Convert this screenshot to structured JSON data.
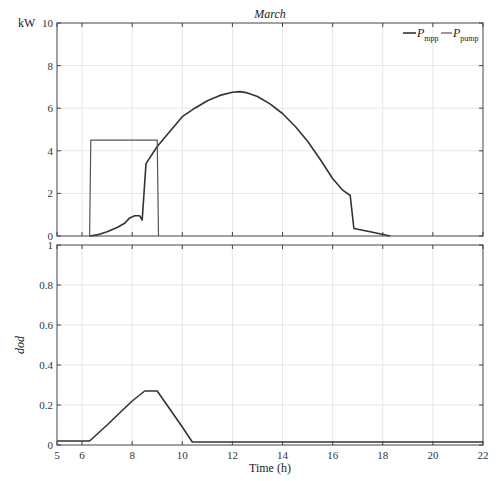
{
  "chart_data": [
    {
      "type": "line",
      "title": "March",
      "xlabel": "",
      "ylabel": "kW",
      "xlim": [
        5,
        22
      ],
      "ylim": [
        0,
        10
      ],
      "x_ticks": [
        5,
        6,
        8,
        10,
        12,
        14,
        16,
        18,
        20,
        22
      ],
      "y_ticks": [
        0,
        2,
        4,
        6,
        8,
        10
      ],
      "grid": true,
      "legend_position": "top-right",
      "series": [
        {
          "name": "P_mpp",
          "label_main": "P",
          "label_sub": "mpp",
          "color": "#333333",
          "width": 1.6,
          "x": [
            6.3,
            6.6,
            7.0,
            7.4,
            7.7,
            7.9,
            8.1,
            8.3,
            8.4,
            8.55,
            9.0,
            9.5,
            10.0,
            10.5,
            11.0,
            11.5,
            12.0,
            12.3,
            12.6,
            13.0,
            13.5,
            14.0,
            14.5,
            15.0,
            15.5,
            16.0,
            16.4,
            16.7,
            16.85,
            17.5,
            18.3
          ],
          "y": [
            0.0,
            0.05,
            0.2,
            0.4,
            0.6,
            0.85,
            0.95,
            0.95,
            0.75,
            3.4,
            4.2,
            4.9,
            5.6,
            6.0,
            6.35,
            6.6,
            6.75,
            6.78,
            6.72,
            6.55,
            6.2,
            5.75,
            5.15,
            4.45,
            3.6,
            2.7,
            2.15,
            1.9,
            0.35,
            0.2,
            0.0
          ]
        },
        {
          "name": "P_pump",
          "label_main": "P",
          "label_sub": "pump",
          "color": "#555555",
          "width": 1.2,
          "x": [
            6.3,
            6.35,
            9.0,
            9.05
          ],
          "y": [
            0.0,
            4.5,
            4.5,
            0.0
          ]
        }
      ]
    },
    {
      "type": "line",
      "title": "",
      "xlabel": "Time (h)",
      "ylabel": "dod",
      "xlim": [
        5,
        22
      ],
      "ylim": [
        0,
        1
      ],
      "x_ticks": [
        5,
        6,
        8,
        10,
        12,
        14,
        16,
        18,
        20,
        22
      ],
      "y_ticks": [
        0,
        0.2,
        0.4,
        0.6,
        0.8,
        1
      ],
      "grid": true,
      "series": [
        {
          "name": "dod",
          "color": "#333333",
          "width": 1.6,
          "x": [
            5,
            6.3,
            7.0,
            7.5,
            8.0,
            8.5,
            9.0,
            9.5,
            10.0,
            10.4,
            22
          ],
          "y": [
            0.02,
            0.02,
            0.1,
            0.16,
            0.22,
            0.27,
            0.27,
            0.18,
            0.09,
            0.015,
            0.015
          ]
        }
      ]
    }
  ],
  "labels": {
    "top_title": "March",
    "top_ylabel": "kW",
    "bottom_ylabel": "dod",
    "bottom_xlabel": "Time (h)",
    "legend_mpp_main": "P",
    "legend_mpp_sub": "mpp",
    "legend_pump_main": "P",
    "legend_pump_sub": "pump"
  }
}
